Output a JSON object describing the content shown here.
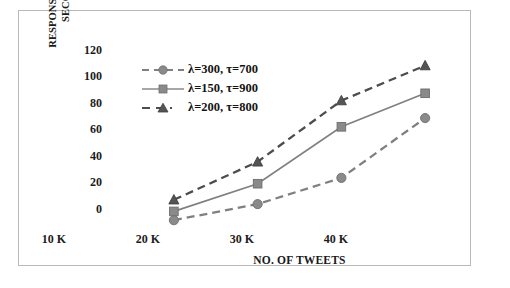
{
  "chart_data": {
    "type": "line",
    "title": "",
    "xlabel": "NO. OF TWEETS",
    "ylabel": "RESPONSE TIME (IN\nSECONDS)",
    "categories": [
      "10 K",
      "20 K",
      "30 K",
      "40 K"
    ],
    "ylim": [
      0,
      120
    ],
    "yticks": [
      0,
      20,
      40,
      60,
      80,
      100,
      120
    ],
    "grid": false,
    "legend_position": "upper-left-inside",
    "series": [
      {
        "name": "λ=300, τ=700",
        "values": [
          4,
          15,
          33,
          74
        ],
        "marker": "circle",
        "line_style": "dashed",
        "color": "#808080"
      },
      {
        "name": "λ=150, τ=900",
        "values": [
          10,
          29,
          68,
          91
        ],
        "marker": "square",
        "line_style": "solid",
        "color": "#808080"
      },
      {
        "name": "λ=200, τ=800",
        "values": [
          18,
          44,
          86,
          110
        ],
        "marker": "triangle",
        "line_style": "dashed",
        "color": "#4d4d4d"
      }
    ]
  },
  "axis": {
    "ytick_labels": [
      "120",
      "100",
      "80",
      "60",
      "40",
      "20",
      "0"
    ],
    "xtick_labels": [
      "10 K",
      "20 K",
      "30 K",
      "40 K"
    ]
  },
  "legend": {
    "items": [
      {
        "label": "λ=300, τ=700",
        "icon": "dashed-circle-marker"
      },
      {
        "label": "λ=150, τ=900",
        "icon": "solid-square-marker"
      },
      {
        "label": "λ=200, τ=800",
        "icon": "dashed-triangle-marker"
      }
    ]
  }
}
